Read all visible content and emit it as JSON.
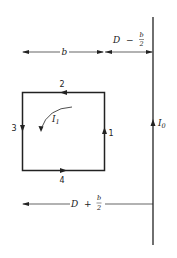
{
  "diagram": {
    "loop": {
      "sides": [
        {
          "id": "1",
          "label": "1",
          "position": "right",
          "current_direction": "up"
        },
        {
          "id": "2",
          "label": "2",
          "position": "top",
          "current_direction": "left"
        },
        {
          "id": "3",
          "label": "3",
          "position": "left",
          "current_direction": "down"
        },
        {
          "id": "4",
          "label": "4",
          "position": "bottom",
          "current_direction": "right"
        }
      ],
      "current_label": "I",
      "current_subscript": "1"
    },
    "wire": {
      "current_label": "I",
      "current_subscript": "0",
      "current_direction": "up"
    },
    "dimensions": {
      "loop_width": "b",
      "gap_top": {
        "prefix": "D",
        "operator": "−",
        "num": "b",
        "den": "2"
      },
      "gap_bottom": {
        "prefix": "D",
        "operator": "+",
        "num": "b",
        "den": "2"
      }
    },
    "colors": {
      "line": "#222222",
      "background": "#ffffff"
    }
  }
}
